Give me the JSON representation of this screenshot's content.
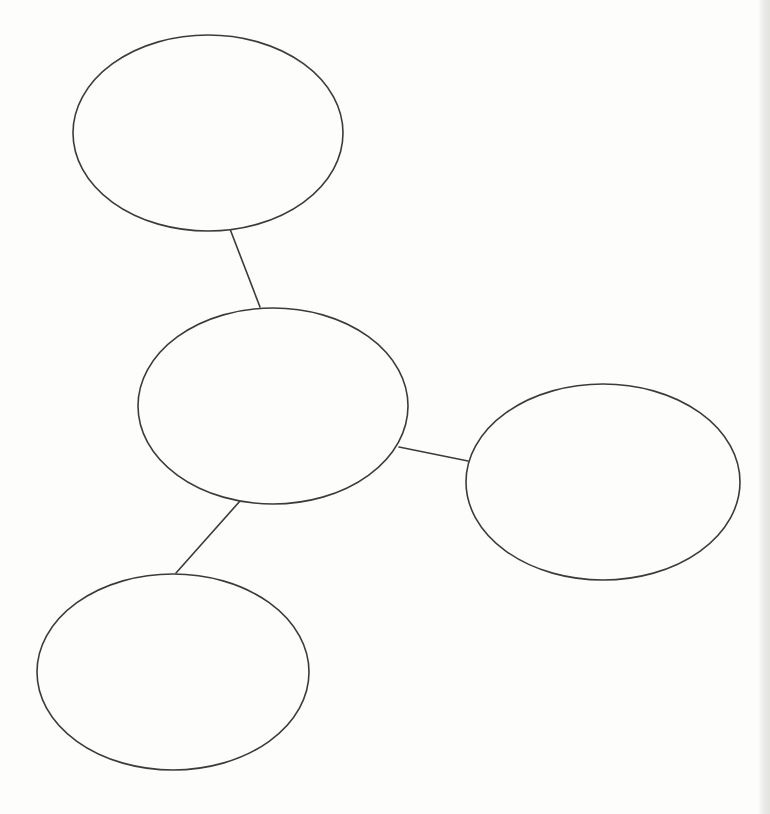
{
  "diagram": {
    "type": "concept-map-template",
    "description_not_rendered": "",
    "canvas": {
      "width": 770,
      "height": 814
    },
    "style": {
      "stroke_color": "#3b3b3b",
      "stroke_width": 1.6,
      "node_fill": "#fdfdfc",
      "page_background": "#fdfdfc",
      "scan_edge_color": "#e9e9e6"
    },
    "nodes": [
      {
        "id": "bubble-top-left",
        "label": "",
        "cx": 208,
        "cy": 133,
        "rx": 135,
        "ry": 98
      },
      {
        "id": "bubble-center",
        "label": "",
        "cx": 273,
        "cy": 406,
        "rx": 135,
        "ry": 98
      },
      {
        "id": "bubble-right",
        "label": "",
        "cx": 603,
        "cy": 482,
        "rx": 137,
        "ry": 98
      },
      {
        "id": "bubble-bottom-left",
        "label": "",
        "cx": 173,
        "cy": 672,
        "rx": 136,
        "ry": 98
      }
    ],
    "edges": [
      {
        "id": "connector-topleft-center",
        "from": "bubble-top-left",
        "to": "bubble-center",
        "x1": 230,
        "y1": 229,
        "x2": 260,
        "y2": 307
      },
      {
        "id": "connector-center-right",
        "from": "bubble-center",
        "to": "bubble-right",
        "x1": 399,
        "y1": 447,
        "x2": 468,
        "y2": 461
      },
      {
        "id": "connector-center-bottomleft",
        "from": "bubble-center",
        "to": "bubble-bottom-left",
        "x1": 240,
        "y1": 501,
        "x2": 176,
        "y2": 573
      }
    ]
  }
}
